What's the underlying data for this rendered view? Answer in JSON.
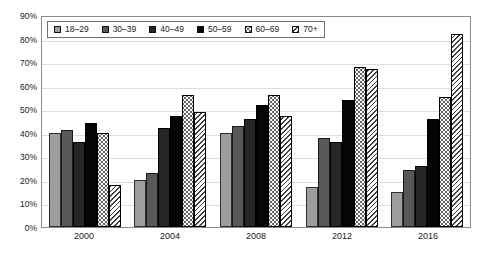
{
  "chart_data": {
    "type": "bar",
    "title": "",
    "subtitle": "",
    "xlabel": "",
    "ylabel": "",
    "categories": [
      "2000",
      "2004",
      "2008",
      "2012",
      "2016"
    ],
    "ylim": [
      0,
      90
    ],
    "ytick_labels": [
      "0%",
      "10%",
      "20%",
      "30%",
      "40%",
      "50%",
      "60%",
      "70%",
      "80%",
      "90%"
    ],
    "ytick_values": [
      0,
      10,
      20,
      30,
      40,
      50,
      60,
      70,
      80,
      90
    ],
    "grid": true,
    "legend_position": "top-left",
    "series": [
      {
        "name": "18–29",
        "pattern": "solid-light-gray",
        "color": "#9d9d9d",
        "values": [
          40,
          20,
          40,
          17,
          15
        ]
      },
      {
        "name": "30–39",
        "pattern": "solid-dark-gray",
        "color": "#585858",
        "values": [
          41,
          23,
          43,
          38,
          24
        ]
      },
      {
        "name": "40–49",
        "pattern": "solid-near-black",
        "color": "#262626",
        "values": [
          36,
          42,
          46,
          36,
          26
        ]
      },
      {
        "name": "50–59",
        "pattern": "solid-black",
        "color": "#050505",
        "values": [
          44,
          47,
          52,
          54,
          46
        ]
      },
      {
        "name": "60–69",
        "pattern": "dotted",
        "color": "#fbfbfb",
        "values": [
          40,
          56,
          56,
          68,
          55
        ]
      },
      {
        "name": "70+",
        "pattern": "diagonal-hatch",
        "color": "#f2f2f2",
        "values": [
          18,
          49,
          47,
          67,
          82
        ]
      }
    ]
  },
  "legend": {
    "items": [
      {
        "label": "18–29"
      },
      {
        "label": "30–39"
      },
      {
        "label": "40–49"
      },
      {
        "label": "50–59"
      },
      {
        "label": "60–69"
      },
      {
        "label": "70+"
      }
    ]
  }
}
